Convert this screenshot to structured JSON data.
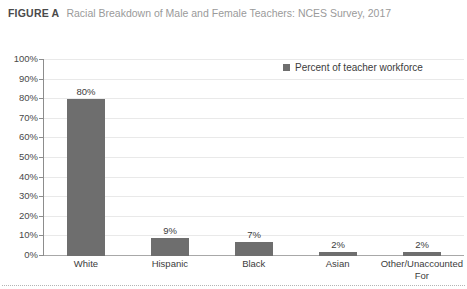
{
  "figure": {
    "label": "FIGURE A",
    "title": "Racial Breakdown of Male and Female Teachers: NCES Survey, 2017"
  },
  "legend": {
    "label": "Percent of teacher workforce",
    "swatch_color": "#6e6e6e",
    "position": "top-right"
  },
  "colors": {
    "bar": "#6e6e6e",
    "gridline": "#e9e9e9",
    "axis": "#8d8d8d",
    "baseline": "#a8a8a8",
    "title_label": "#4a4a4a",
    "title_text": "#9a9a9a",
    "tick_text": "#3c3c3c",
    "bottom_rule": "#b4b4b4"
  },
  "chart_data": {
    "type": "bar",
    "title": "Racial Breakdown of Male and Female Teachers: NCES Survey, 2017",
    "xlabel": "",
    "ylabel": "",
    "categories": [
      "White",
      "Hispanic",
      "Black",
      "Asian",
      "Other/Unaccounted For"
    ],
    "values": [
      80,
      9,
      7,
      2,
      2
    ],
    "value_labels": [
      "80%",
      "9%",
      "7%",
      "2%",
      "2%"
    ],
    "series": [
      {
        "name": "Percent of teacher workforce",
        "values": [
          80,
          9,
          7,
          2,
          2
        ]
      }
    ],
    "ylim": [
      0,
      100
    ],
    "ytick_step": 10,
    "ytick_labels": [
      "100%",
      "90%",
      "80%",
      "70%",
      "60%",
      "50%",
      "40%",
      "30%",
      "20%",
      "10%",
      "0%"
    ],
    "ytick_values": [
      100,
      90,
      80,
      70,
      60,
      50,
      40,
      30,
      20,
      10,
      0
    ],
    "grid": true,
    "legend_position": "top-right",
    "value_label_format": "percent"
  }
}
